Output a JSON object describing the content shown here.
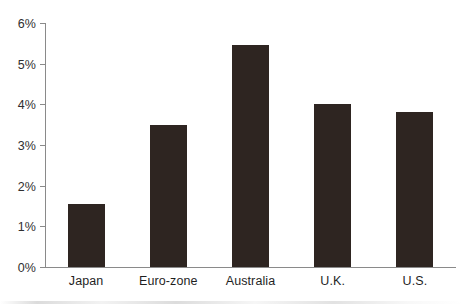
{
  "chart_data": {
    "type": "bar",
    "title": "",
    "subtitle": "",
    "xlabel": "",
    "ylabel": "",
    "categories": [
      "Japan",
      "Euro-zone",
      "Australia",
      "U.K.",
      "U.S."
    ],
    "values": [
      1.55,
      3.5,
      5.45,
      4.0,
      3.8
    ],
    "value_format": "percent",
    "ylim": [
      0,
      6
    ],
    "ytick_values": [
      0,
      1,
      2,
      3,
      4,
      5,
      6
    ],
    "ytick_labels": [
      "0%",
      "1%",
      "2%",
      "3%",
      "4%",
      "5%",
      "6%"
    ],
    "grid": false,
    "legend": null,
    "legend_position": "none",
    "bar_color": "#2e2521",
    "axis_color": "#8a8a8a",
    "background_color": "#ffffff",
    "text_color": "#1f1f1f",
    "annotations": []
  },
  "axis": {
    "y_ticks": [
      {
        "label": "6%",
        "value": 6
      },
      {
        "label": "5%",
        "value": 5
      },
      {
        "label": "4%",
        "value": 4
      },
      {
        "label": "3%",
        "value": 3
      },
      {
        "label": "2%",
        "value": 2
      },
      {
        "label": "1%",
        "value": 1
      },
      {
        "label": "0%",
        "value": 0
      }
    ]
  }
}
